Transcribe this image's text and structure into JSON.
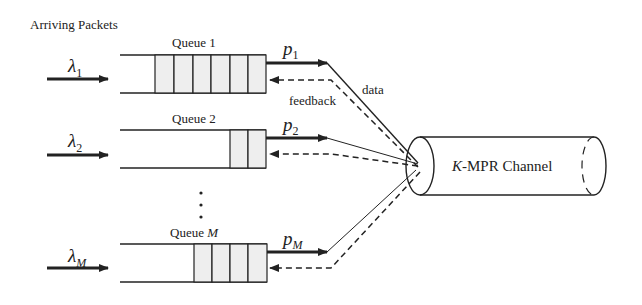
{
  "title": "Arriving Packets",
  "colors": {
    "line": "#222222",
    "cell_fill": "#eeeeee",
    "background": "#ffffff"
  },
  "queues": [
    {
      "label": "Queue 1",
      "label_suffix": "",
      "arrival_symbol": "λ",
      "arrival_sub": "1",
      "tx_symbol": "p",
      "tx_sub": "1",
      "packets": 6
    },
    {
      "label": "Queue 2",
      "label_suffix": "",
      "arrival_symbol": "λ",
      "arrival_sub": "2",
      "tx_symbol": "p",
      "tx_sub": "2",
      "packets": 2
    },
    {
      "label": "Queue ",
      "label_suffix": "M",
      "arrival_symbol": "λ",
      "arrival_sub": "M",
      "tx_symbol": "p",
      "tx_sub": "M",
      "packets": 4
    }
  ],
  "ellipsis": "⋮",
  "links": {
    "data_label": "data",
    "feedback_label": "feedback"
  },
  "channel": {
    "prefix": "K",
    "label": "-MPR Channel"
  }
}
